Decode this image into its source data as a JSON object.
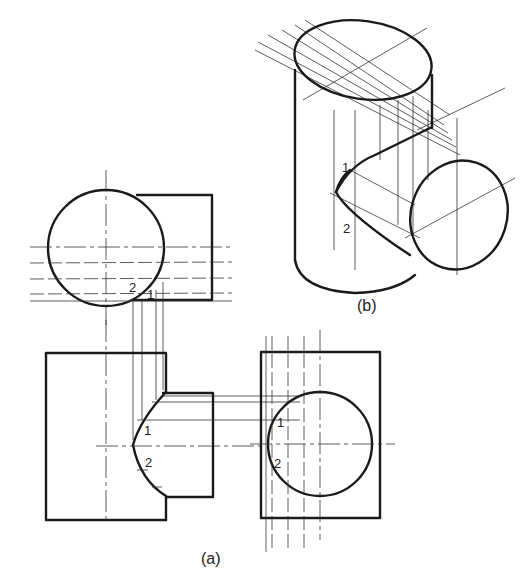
{
  "figure": {
    "views": {
      "top_view": {
        "point_labels": [
          "2",
          "1"
        ]
      },
      "front_view": {
        "point_labels": [
          "1",
          "2"
        ]
      },
      "side_view": {
        "point_labels": [
          "1",
          "2"
        ]
      },
      "pictorial": {
        "point_labels": [
          "1",
          "2"
        ]
      }
    },
    "captions": {
      "orthographic": "(a)",
      "pictorial": "(b)"
    }
  }
}
